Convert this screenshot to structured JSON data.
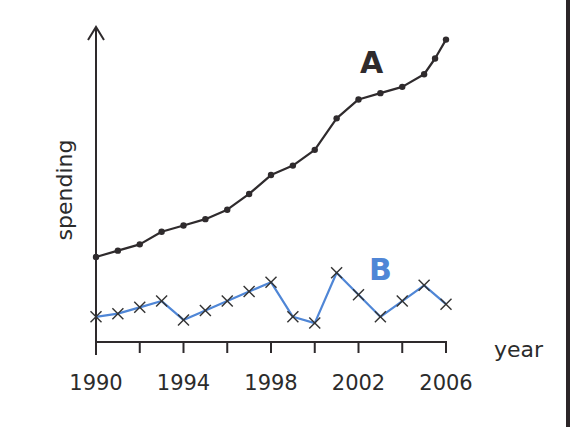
{
  "chart_data": {
    "type": "line",
    "title": "",
    "xlabel": "year",
    "ylabel": "spending",
    "x": [
      1990,
      1991,
      1992,
      1993,
      1994,
      1995,
      1996,
      1997,
      1998,
      1999,
      2000,
      2001,
      2002,
      2003,
      2004,
      2005,
      2005.5,
      2006
    ],
    "x_tick_labels": [
      "1990",
      "1994",
      "1998",
      "2002",
      "2006"
    ],
    "x_ticks": [
      1990,
      1992,
      1994,
      1996,
      1998,
      2000,
      2002,
      2004,
      2006
    ],
    "xlim": [
      1990,
      2006
    ],
    "ylim": [
      0,
      100
    ],
    "y_ticks": [],
    "grid": false,
    "legend": "inline labels",
    "series": [
      {
        "name": "A",
        "color": "#2f2b2d",
        "marker": "dot",
        "x": [
          1990,
          1991,
          1992,
          1993,
          1994,
          1995,
          1996,
          1997,
          1998,
          1999,
          2000,
          2001,
          2002,
          2003,
          2004,
          2005,
          2005.5,
          2006
        ],
        "values": [
          27,
          29,
          31,
          35,
          37,
          39,
          42,
          47,
          53,
          56,
          61,
          71,
          77,
          79,
          81,
          85,
          90,
          96
        ]
      },
      {
        "name": "B",
        "color": "#4f86d6",
        "marker": "x",
        "x": [
          1990,
          1991,
          1992,
          1993,
          1994,
          1995,
          1996,
          1997,
          1998,
          1999,
          2000,
          2001,
          2002,
          2003,
          2004,
          2005,
          2006
        ],
        "values": [
          8,
          9,
          11,
          13,
          7,
          10,
          13,
          16,
          19,
          8,
          6,
          22,
          15,
          8,
          13,
          18,
          12
        ]
      }
    ],
    "annotations": [
      {
        "text": "A",
        "color": "#2f2b2d",
        "near_series": "A"
      },
      {
        "text": "B",
        "color": "#4f86d6",
        "near_series": "B"
      }
    ]
  },
  "labels": {
    "xlabel": "year",
    "ylabel": "spending",
    "series_a": "A",
    "series_b": "B",
    "ticks": [
      "1990",
      "1994",
      "1998",
      "2002",
      "2006"
    ]
  }
}
